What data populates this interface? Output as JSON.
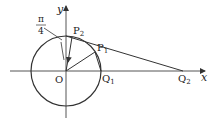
{
  "diagram": {
    "axis_labels": {
      "x": "x",
      "y": "y"
    },
    "origin_label": "O",
    "points": {
      "P1": {
        "label": "P",
        "sub": "1"
      },
      "P2": {
        "label": "P",
        "sub": "2"
      },
      "Q1": {
        "label": "Q",
        "sub": "1"
      },
      "Q2": {
        "label": "Q",
        "sub": "2"
      }
    },
    "angle_label": {
      "numerator": "π",
      "denominator": "4"
    },
    "stroke_color": "#333333"
  }
}
